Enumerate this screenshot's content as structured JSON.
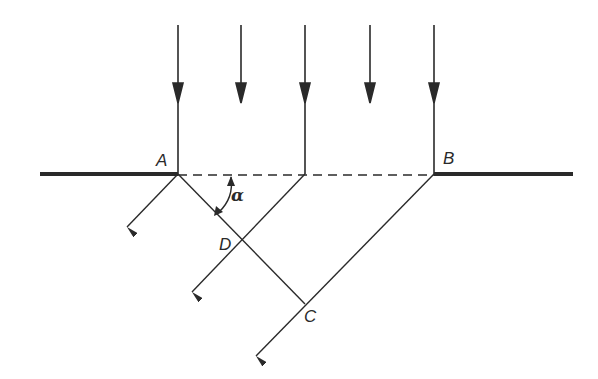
{
  "diagram": {
    "colors": {
      "line": "#2a2a2a",
      "background": "#ffffff"
    },
    "labels": {
      "A": "A",
      "B": "B",
      "C": "C",
      "D": "D",
      "alpha": "α"
    },
    "points": {
      "A": [
        178,
        174
      ],
      "B": [
        434,
        174
      ],
      "C": [
        305,
        304
      ],
      "D": [
        242,
        240
      ]
    },
    "incident_rays_x": [
      178,
      241,
      305,
      370,
      434
    ],
    "walls": [
      {
        "from": [
          40,
          174
        ],
        "to": [
          178,
          174
        ]
      },
      {
        "from": [
          434,
          174
        ],
        "to": [
          573,
          174
        ]
      }
    ],
    "diffracted_rays": [
      {
        "from": [
          178,
          174
        ],
        "to": [
          127,
          227
        ]
      },
      {
        "from": [
          305,
          174
        ],
        "to": [
          192,
          292
        ]
      },
      {
        "from": [
          434,
          174
        ],
        "to": [
          256,
          356
        ]
      }
    ],
    "perpendicular": {
      "from": [
        178,
        174
      ],
      "to": [
        305,
        304
      ]
    }
  }
}
